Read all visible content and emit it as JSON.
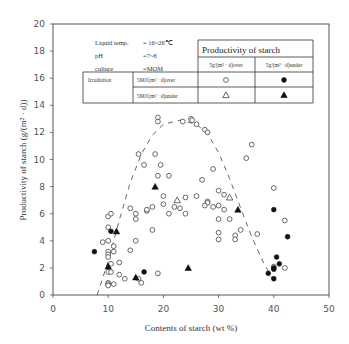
{
  "chart_data": {
    "type": "scatter",
    "title": "",
    "xlabel": "Contents of starch  (wt %)",
    "ylabel": "Productivity of starch  (g/(m² · d))",
    "xlim": [
      0,
      50
    ],
    "ylim": [
      0,
      20
    ],
    "xticks": [
      0,
      10,
      20,
      30,
      40,
      50
    ],
    "yticks": [
      0,
      2,
      4,
      6,
      8,
      10,
      12,
      14,
      16,
      18,
      20
    ],
    "grid": false,
    "conditions": {
      "liquid_temp_label": "Liquid temp.",
      "liquid_temp_value": "= 16~26℃",
      "ph_label": "pH",
      "ph_value": "=7~8",
      "culture_label": "culture",
      "culture_value": "=MOM"
    },
    "legend": {
      "header": "Productivity of starch",
      "col1": "5g/(m² · d)over",
      "col2": "5g/(m² · d)under",
      "row_group": "Irradiation",
      "row1": "5MJ/(m² · d)over",
      "row2": "5MJ/(m² · d)under"
    },
    "series": [
      {
        "name": "Irradiation 5MJ over / Productivity 5g over",
        "marker": "open-circle",
        "points": [
          [
            19,
            13.1
          ],
          [
            19,
            12.8
          ],
          [
            23.5,
            12.8
          ],
          [
            25,
            13.0
          ],
          [
            25.2,
            12.9
          ],
          [
            26,
            12.6
          ],
          [
            27.5,
            12.2
          ],
          [
            28,
            12.0
          ],
          [
            15.5,
            10.4
          ],
          [
            18.5,
            10.4
          ],
          [
            16.5,
            9.6
          ],
          [
            19.5,
            9.6
          ],
          [
            19,
            8.8
          ],
          [
            21,
            8.8
          ],
          [
            27,
            8.5
          ],
          [
            29,
            9.3
          ],
          [
            36,
            11.1
          ],
          [
            35,
            10.1
          ],
          [
            20,
            7.3
          ],
          [
            24,
            7.2
          ],
          [
            26,
            7.3
          ],
          [
            28,
            6.9
          ],
          [
            30,
            7.7
          ],
          [
            31,
            7.4
          ],
          [
            14,
            6.4
          ],
          [
            17,
            6.2
          ],
          [
            21,
            6.0
          ],
          [
            24,
            6.0
          ],
          [
            28,
            6.8
          ],
          [
            29,
            6.5
          ],
          [
            27.5,
            6.6
          ],
          [
            30,
            6.6
          ],
          [
            31,
            6.3
          ],
          [
            10,
            5.8
          ],
          [
            10.5,
            6.0
          ],
          [
            15,
            6.0
          ],
          [
            15,
            5.6
          ],
          [
            17,
            6.3
          ],
          [
            18,
            6.5
          ],
          [
            20,
            6.7
          ],
          [
            22,
            6.5
          ],
          [
            23,
            6.4
          ],
          [
            10,
            5.0
          ],
          [
            18,
            4.8
          ],
          [
            34,
            4.8
          ],
          [
            30,
            5.6
          ],
          [
            32,
            5.6
          ],
          [
            30,
            4.6
          ],
          [
            33,
            4.4
          ],
          [
            37,
            4.5
          ],
          [
            9,
            3.9
          ],
          [
            10,
            4.0
          ],
          [
            11,
            3.6
          ],
          [
            10,
            3.2
          ],
          [
            11,
            3.2
          ],
          [
            14,
            3.3
          ],
          [
            15,
            4.0
          ],
          [
            30,
            4.1
          ],
          [
            33,
            4.1
          ],
          [
            10,
            3.0
          ],
          [
            10,
            2.8
          ],
          [
            10.5,
            2.3
          ],
          [
            12,
            2.4
          ],
          [
            10,
            1.7
          ],
          [
            10.5,
            1.7
          ],
          [
            12,
            1.5
          ],
          [
            15.5,
            1.2
          ],
          [
            16,
            0.9
          ],
          [
            19,
            1.6
          ],
          [
            10,
            0.9
          ],
          [
            10,
            0.8
          ],
          [
            10,
            0.7
          ],
          [
            11,
            0.8
          ],
          [
            13,
            1.2
          ],
          [
            40,
            7.9
          ],
          [
            40,
            2.1
          ],
          [
            42,
            2.0
          ],
          [
            42,
            5.5
          ]
        ]
      },
      {
        "name": "Irradiation 5MJ over / Productivity 5g under",
        "marker": "filled-circle",
        "points": [
          [
            7.5,
            3.2
          ],
          [
            10.5,
            4.7
          ],
          [
            16.5,
            1.7
          ],
          [
            40,
            6.3
          ],
          [
            42.5,
            4.3
          ],
          [
            40.5,
            2.8
          ],
          [
            41,
            2.3
          ],
          [
            40,
            2.0
          ],
          [
            39,
            1.6
          ],
          [
            40,
            1.9
          ],
          [
            40,
            1.2
          ]
        ]
      },
      {
        "name": "Irradiation 5MJ under / Productivity 5g over",
        "marker": "open-triangle",
        "points": [
          [
            22.5,
            7.0
          ],
          [
            32,
            7.2
          ]
        ]
      },
      {
        "name": "Irradiation 5MJ under / Productivity 5g under",
        "marker": "filled-triangle",
        "points": [
          [
            18.5,
            8.0
          ],
          [
            33.5,
            6.3
          ],
          [
            10,
            2.1
          ],
          [
            11.5,
            4.7
          ],
          [
            15,
            1.3
          ],
          [
            24.5,
            2.0
          ]
        ]
      }
    ],
    "trend": {
      "style": "dashed",
      "points": [
        [
          8,
          0
        ],
        [
          10,
          2.5
        ],
        [
          12,
          5.5
        ],
        [
          14,
          8.3
        ],
        [
          16,
          10.4
        ],
        [
          18,
          11.8
        ],
        [
          20,
          12.6
        ],
        [
          23,
          12.9
        ],
        [
          26,
          12.6
        ],
        [
          28,
          11.9
        ],
        [
          30,
          10.5
        ],
        [
          32,
          8.6
        ],
        [
          34,
          6.4
        ],
        [
          36,
          4.3
        ],
        [
          38,
          2.5
        ],
        [
          40,
          1.0
        ]
      ]
    }
  }
}
